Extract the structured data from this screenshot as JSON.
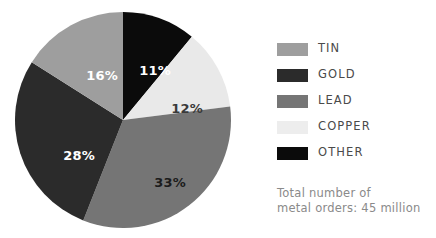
{
  "chart_data": {
    "type": "pie",
    "title": "",
    "categories": [
      "OTHER",
      "COPPER",
      "LEAD",
      "GOLD",
      "TIN"
    ],
    "values": [
      11,
      12,
      33,
      28,
      16
    ],
    "value_unit": "%",
    "start_angle_deg": 0,
    "direction": "clockwise",
    "legend_position": "right",
    "grid": false,
    "slices": [
      {
        "label": "OTHER",
        "value": 11,
        "display": "11%",
        "color": "#0b0b0b",
        "text_color": "#ffffff",
        "label_x": 141,
        "label_y": 60
      },
      {
        "label": "COPPER",
        "value": 12,
        "display": "12%",
        "color": "#e9e9e9",
        "text_color": "#3a3a3a",
        "label_x": 173,
        "label_y": 98
      },
      {
        "label": "LEAD",
        "value": 33,
        "display": "33%",
        "color": "#757575",
        "text_color": "#1c1c1c",
        "label_x": 156,
        "label_y": 172
      },
      {
        "label": "GOLD",
        "value": 28,
        "display": "28%",
        "color": "#2b2b2b",
        "text_color": "#ffffff",
        "label_x": 65,
        "label_y": 145
      },
      {
        "label": "TIN",
        "value": 16,
        "display": "16%",
        "color": "#9e9e9e",
        "text_color": "#ffffff",
        "label_x": 88,
        "label_y": 65
      }
    ]
  },
  "legend": {
    "items": [
      {
        "label": "TIN",
        "color": "#9e9e9e"
      },
      {
        "label": "GOLD",
        "color": "#2b2b2b"
      },
      {
        "label": "LEAD",
        "color": "#757575"
      },
      {
        "label": "COPPER",
        "color": "#ededed"
      },
      {
        "label": "OTHER",
        "color": "#0b0b0b"
      }
    ]
  },
  "footnote": {
    "line1": "Total number of",
    "line2": "metal orders: 45 million"
  },
  "colors": {
    "background": "#ffffff",
    "legend_text": "#4a4a4a",
    "footnote_text": "#8a8a8a"
  }
}
